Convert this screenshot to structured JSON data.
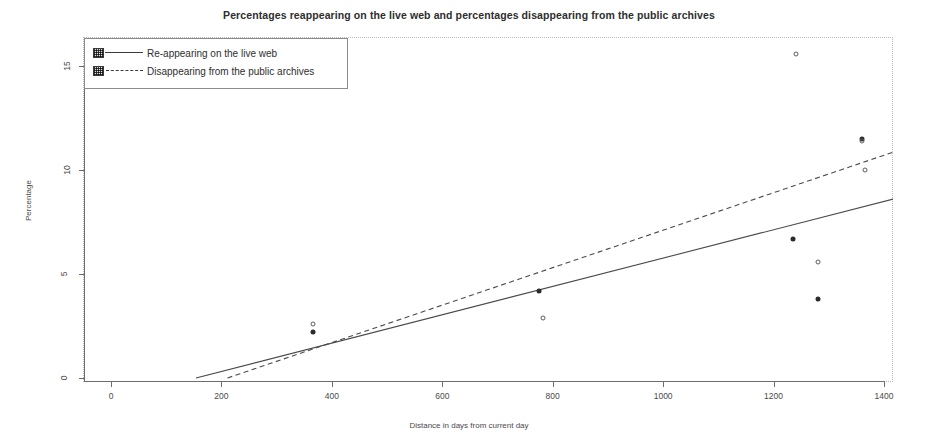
{
  "chart_data": {
    "type": "scatter",
    "title": "Percentages reappearing on the live web and percentages disappearing from the public archives",
    "xlabel": "Distance in days from current day",
    "ylabel": "Percentage",
    "xlim": [
      -40,
      1460
    ],
    "ylim": [
      -0.5,
      16.2
    ],
    "xticks": [
      0,
      200,
      400,
      600,
      800,
      1000,
      1200,
      1400
    ],
    "xticklabels": [
      "0",
      "200",
      "400",
      "600",
      "800",
      "1000",
      "1200",
      "1400"
    ],
    "yticks": [
      0,
      5,
      10,
      15
    ],
    "yticklabels": [
      "0",
      "5",
      "10",
      "15"
    ],
    "grid": false,
    "legend_position": "top-left",
    "series": [
      {
        "name": "Re-appearing on the live web",
        "marker": "filled-circle",
        "linestyle": "solid",
        "points": [
          {
            "x": 366,
            "y": 2.2
          },
          {
            "x": 775,
            "y": 4.2
          },
          {
            "x": 1235,
            "y": 6.7
          },
          {
            "x": 1281,
            "y": 3.8
          },
          {
            "x": 1360,
            "y": 11.5
          }
        ],
        "fit_line": {
          "x0": 154,
          "y0": 0.0,
          "x1": 1460,
          "y1": 8.9
        }
      },
      {
        "name": "Disappearing from the public archives",
        "marker": "open-circle",
        "linestyle": "dashed",
        "points": [
          {
            "x": 366,
            "y": 2.6
          },
          {
            "x": 783,
            "y": 2.9
          },
          {
            "x": 1240,
            "y": 15.6
          },
          {
            "x": 1280,
            "y": 5.6
          },
          {
            "x": 1360,
            "y": 11.4
          },
          {
            "x": 1365,
            "y": 10.0
          }
        ],
        "fit_line": {
          "x0": 211,
          "y0": 0.0,
          "x1": 1460,
          "y1": 11.25
        }
      }
    ]
  },
  "legend": {
    "entries": [
      {
        "label": "Re-appearing on the live web",
        "style": "solid"
      },
      {
        "label": "Disappearing from the public archives",
        "style": "dashed"
      }
    ]
  }
}
